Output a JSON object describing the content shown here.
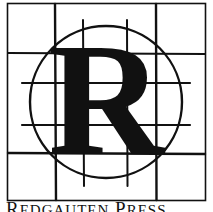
{
  "logo": {
    "letter": "R",
    "description": "Letter R inside a circle over a sketched grid",
    "colors": {
      "ink": "#111111",
      "background": "#ffffff"
    }
  },
  "caption": {
    "first_initial": "R",
    "first_rest": "EDGAUTEN",
    "second_initial": "P",
    "second_rest": "RESS"
  }
}
